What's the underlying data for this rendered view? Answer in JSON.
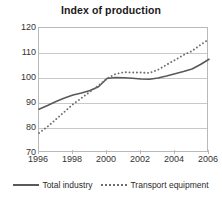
{
  "chart_data": {
    "type": "line",
    "title": "Index of production",
    "xlabel": "",
    "ylabel": "",
    "xlim": [
      1996,
      2006
    ],
    "ylim": [
      70,
      120
    ],
    "ytick_labels": [
      "120",
      "110",
      "100",
      "90",
      "80",
      "70"
    ],
    "ytick_values": [
      120,
      110,
      100,
      90,
      80,
      70
    ],
    "xtick_labels": [
      "1996",
      "1998",
      "2000",
      "2002",
      "2004",
      "2006"
    ],
    "xtick_values": [
      1996,
      1998,
      2000,
      2002,
      2004,
      2006
    ],
    "grid": "horizontal",
    "legend_position": "bottom",
    "x": [
      1996,
      1996.5,
      1997,
      1997.5,
      1998,
      1998.5,
      1999,
      1999.5,
      2000,
      2000.5,
      2001,
      2001.5,
      2002,
      2002.5,
      2003,
      2003.5,
      2004,
      2004.5,
      2005,
      2005.5,
      2006
    ],
    "series": [
      {
        "name": "Total industry",
        "style": "solid",
        "color": "#595959",
        "values": [
          87.5,
          89.0,
          90.6,
          92.0,
          93.2,
          94.0,
          95.0,
          96.5,
          99.8,
          100.2,
          100.1,
          99.9,
          99.6,
          99.5,
          100.0,
          100.8,
          101.7,
          102.6,
          103.6,
          105.4,
          107.5
        ]
      },
      {
        "name": "Transport equipment",
        "style": "dotted",
        "color": "#6e6e6e",
        "values": [
          78.0,
          80.5,
          83.5,
          86.5,
          89.5,
          92.0,
          94.5,
          97.0,
          99.8,
          101.6,
          102.3,
          102.2,
          102.2,
          102.0,
          103.3,
          105.3,
          107.2,
          109.2,
          110.8,
          113.3,
          115.5
        ]
      }
    ]
  },
  "legend": {
    "entries": [
      {
        "label": "Total industry"
      },
      {
        "label": "Transport equipment"
      }
    ]
  }
}
